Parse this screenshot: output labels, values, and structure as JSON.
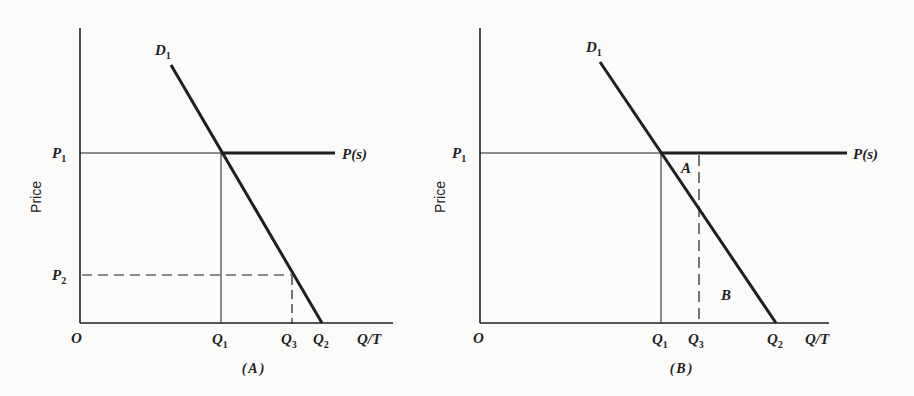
{
  "figure": {
    "panels": [
      {
        "id": "A",
        "caption": "(A)",
        "y_axis_title": "Price",
        "origin_label": "O",
        "x_axis_label": "Q/T",
        "demand_label": {
          "main": "D",
          "sub": "1"
        },
        "supply_label": "P(s)",
        "price_labels": [
          {
            "main": "P",
            "sub": "1"
          },
          {
            "main": "P",
            "sub": "2"
          }
        ],
        "quantity_labels": [
          {
            "main": "Q",
            "sub": "1"
          },
          {
            "main": "Q",
            "sub": "3"
          },
          {
            "main": "Q",
            "sub": "2"
          }
        ]
      },
      {
        "id": "B",
        "caption": "(B)",
        "y_axis_title": "Price",
        "origin_label": "O",
        "x_axis_label": "Q/T",
        "demand_label": {
          "main": "D",
          "sub": "1"
        },
        "supply_label": "P(s)",
        "price_labels": [
          {
            "main": "P",
            "sub": "1"
          }
        ],
        "quantity_labels": [
          {
            "main": "Q",
            "sub": "1"
          },
          {
            "main": "Q",
            "sub": "3"
          },
          {
            "main": "Q",
            "sub": "2"
          }
        ],
        "region_labels": [
          "A",
          "B"
        ]
      }
    ],
    "colors": {
      "ink": "#1f1f1f",
      "background": "#fbfbf9"
    }
  }
}
